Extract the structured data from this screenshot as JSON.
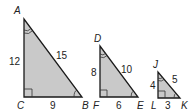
{
  "figure": {
    "fill_color": "#c9c9c9",
    "stroke_color": "#1a1a1a"
  },
  "triangles": [
    {
      "name": "ABC",
      "vertices": {
        "top": "A",
        "right_angle": "C",
        "base_end": "B"
      },
      "sides": {
        "vertical": "12",
        "hypotenuse": "15",
        "base": "9"
      }
    },
    {
      "name": "DEF",
      "vertices": {
        "top": "D",
        "right_angle": "F",
        "base_end": "E"
      },
      "sides": {
        "vertical": "8",
        "hypotenuse": "10",
        "base": "6"
      }
    },
    {
      "name": "JKL",
      "vertices": {
        "top": "J",
        "right_angle": "L",
        "base_end": "K"
      },
      "sides": {
        "vertical": "4",
        "hypotenuse": "5",
        "base": "3"
      }
    }
  ]
}
